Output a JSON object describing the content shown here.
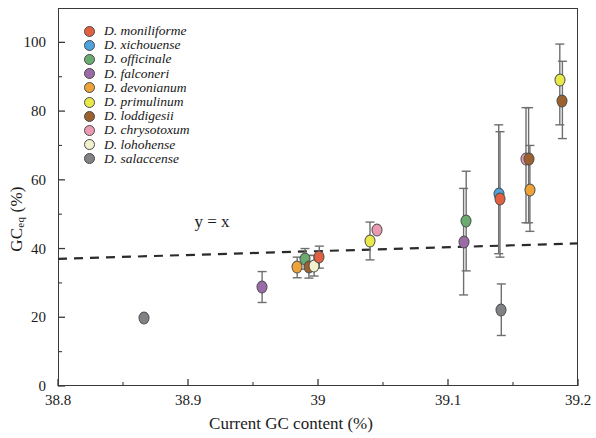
{
  "chart_data": {
    "type": "scatter",
    "title": "",
    "xlabel": "Current GC content (%)",
    "ylabel": "GCeq (%)",
    "ylabel_main": "GC",
    "ylabel_sub": "eq",
    "ylabel_unit": " (%)",
    "xlim": [
      38.8,
      39.2
    ],
    "ylim": [
      0,
      110
    ],
    "xticks": [
      "38.8",
      "38.9",
      "39",
      "39.1",
      "39.2"
    ],
    "xtick_values": [
      38.8,
      38.9,
      39.0,
      39.1,
      39.2
    ],
    "yticks": [
      "0",
      "20",
      "40",
      "60",
      "80",
      "100"
    ],
    "ytick_values": [
      0,
      20,
      40,
      60,
      80,
      100
    ],
    "grid": false,
    "legend_position": "top-left",
    "annotations": [
      {
        "text": "y = x",
        "x": 38.905,
        "y": 47.5
      }
    ],
    "reference_line": {
      "label": "y = x",
      "style": "dashed",
      "color": "#2b2b2b",
      "x_start": 38.8,
      "x_end": 39.2,
      "y_start": 37.0,
      "y_end": 41.5
    },
    "series": [
      {
        "name": "D. moniliforme",
        "color": "#e2603f"
      },
      {
        "name": "D. xichouense",
        "color": "#4ca3dd"
      },
      {
        "name": "D. officinale",
        "color": "#6aab6f"
      },
      {
        "name": "D. falconeri",
        "color": "#9b6aa8"
      },
      {
        "name": "D. devonianum",
        "color": "#eda337"
      },
      {
        "name": "D. primulinum",
        "color": "#e9e94a"
      },
      {
        "name": "D. loddigesii",
        "color": "#9b6230"
      },
      {
        "name": "D. chrysotoxum",
        "color": "#eb9ab1"
      },
      {
        "name": "D. lohohense",
        "color": "#f3f0cd"
      },
      {
        "name": "D. salaccense",
        "color": "#808285"
      }
    ],
    "points": [
      {
        "species": "D. salaccense",
        "x": 38.866,
        "y": 19.8,
        "err_low": 0.0,
        "err_high": 0.0
      },
      {
        "species": "D. falconeri",
        "x": 38.957,
        "y": 28.8,
        "err_low": 4.5,
        "err_high": 4.5
      },
      {
        "species": "D. devonianum",
        "x": 38.984,
        "y": 34.5,
        "err_low": 3.0,
        "err_high": 3.0
      },
      {
        "species": "D. officinale",
        "x": 38.99,
        "y": 37.0,
        "err_low": 3.0,
        "err_high": 3.0
      },
      {
        "species": "D. loddigesii",
        "x": 38.993,
        "y": 34.7,
        "err_low": 3.3,
        "err_high": 3.3
      },
      {
        "species": "D. lohohense",
        "x": 38.997,
        "y": 35.0,
        "err_low": 3.0,
        "err_high": 3.0
      },
      {
        "species": "D. moniliforme",
        "x": 39.001,
        "y": 37.5,
        "err_low": 3.2,
        "err_high": 3.2
      },
      {
        "species": "D. primulinum",
        "x": 39.04,
        "y": 42.2,
        "err_low": 5.5,
        "err_high": 5.5
      },
      {
        "species": "D. chrysotoxum",
        "x": 39.045,
        "y": 45.5,
        "err_low": 0.0,
        "err_high": 0.0
      },
      {
        "species": "D. falconeri",
        "x": 39.112,
        "y": 42.0,
        "err_low": 15.5,
        "err_high": 15.5
      },
      {
        "species": "D. officinale",
        "x": 39.114,
        "y": 48.0,
        "err_low": 14.5,
        "err_high": 14.5
      },
      {
        "species": "D. xichouense",
        "x": 39.139,
        "y": 56.0,
        "err_low": 17.5,
        "err_high": 20.0
      },
      {
        "species": "D. moniliforme",
        "x": 39.14,
        "y": 54.5,
        "err_low": 17.0,
        "err_high": 19.5
      },
      {
        "species": "D. salaccense",
        "x": 39.141,
        "y": 22.2,
        "err_low": 7.5,
        "err_high": 7.5
      },
      {
        "species": "D. chrysotoxum",
        "x": 39.16,
        "y": 66.0,
        "err_low": 18.5,
        "err_high": 15.0
      },
      {
        "species": "D. loddigesii",
        "x": 39.162,
        "y": 66.0,
        "err_low": 18.5,
        "err_high": 15.0
      },
      {
        "species": "D. devonianum",
        "x": 39.163,
        "y": 57.0,
        "err_low": 12.0,
        "err_high": 13.0
      },
      {
        "species": "D. primulinum",
        "x": 39.186,
        "y": 89.0,
        "err_low": 13.0,
        "err_high": 10.5
      },
      {
        "species": "D. loddigesii",
        "x": 39.188,
        "y": 83.0,
        "err_low": 11.0,
        "err_high": 11.5
      }
    ]
  }
}
